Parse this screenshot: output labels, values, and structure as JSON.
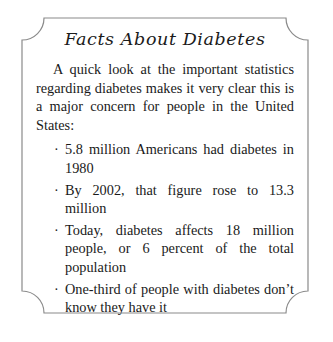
{
  "card": {
    "title": "Facts About Diabetes",
    "intro": "A quick look at the important statistics regarding diabetes makes it very clear this is a major concern for people in the United States:",
    "bullet_glyph": "·",
    "bullets": [
      "5.8 million Americans had diabetes in 1980",
      "By 2002, that figure rose to 13.3 million",
      "Today, diabetes affects 18 million people, or 6 percent of the total population",
      "One-third of people with diabetes don’t know they have it"
    ]
  },
  "colors": {
    "text": "#1a1a1a",
    "border": "#8a8a8a",
    "background": "#ffffff"
  }
}
